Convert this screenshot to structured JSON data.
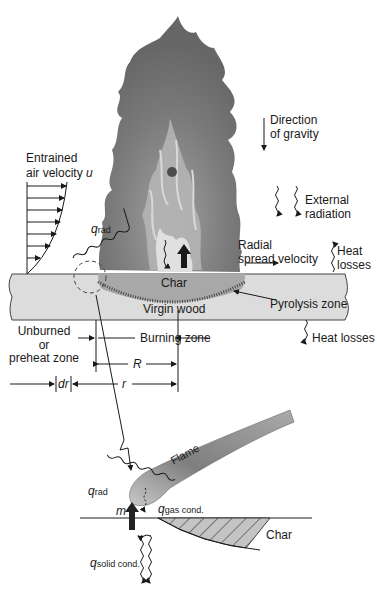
{
  "diagram": {
    "type": "flame-spread-schematic",
    "upper": {
      "labels": {
        "gravity_line1": "Direction",
        "gravity_line2": "of gravity",
        "entrained_line1": "Entrained",
        "entrained_line2": "air velocity",
        "entrained_var": "u",
        "external_line1": "External",
        "external_line2": "radiation",
        "q_rad_symbol": "q",
        "q_rad_marks": "˙″",
        "q_rad_sub": "rad",
        "radial_line1": "Radial",
        "radial_line2": "spread velocity",
        "heat_losses_top_line1": "Heat",
        "heat_losses_top_line2": "losses",
        "char": "Char",
        "pyrolysis": "Pyrolysis zone",
        "virgin_wood": "Virgin wood",
        "heat_losses_bottom": "Heat losses",
        "unburned_line1": "Unburned",
        "unburned_line2": "or",
        "unburned_line3": "preheat zone",
        "burning_zone": "Burning zone",
        "R": "R",
        "r": "r",
        "dr": "dr"
      },
      "colors": {
        "flame_outer": "#6f6f6f",
        "flame_inner": "#9a9a9a",
        "flame_core": "#d6d6d6",
        "wood": "#dcdcdc",
        "char": "#a8a8a8",
        "line": "#1a1a1a"
      }
    },
    "lower": {
      "labels": {
        "flame": "Flame",
        "q_rad_sub": "rad",
        "m_symbol": "m",
        "q_gas_sub": "gas cond.",
        "q_solid_sub": "solid cond.",
        "char": "Char"
      }
    }
  }
}
